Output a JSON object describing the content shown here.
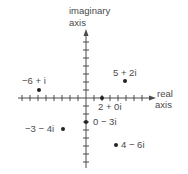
{
  "diagram": {
    "axes": {
      "imaginary_label_line1": "imaginary",
      "imaginary_label_line2": "axis",
      "real_label_line1": "real",
      "real_label_line2": "axis",
      "x_range": [
        -9,
        9
      ],
      "y_range": [
        -8,
        8
      ]
    },
    "points": [
      {
        "re": -6,
        "im": 1,
        "label": "−6 + i"
      },
      {
        "re": 5,
        "im": 2,
        "label": "5 + 2i"
      },
      {
        "re": 2,
        "im": 0,
        "label": "2 + 0i"
      },
      {
        "re": 0,
        "im": -3,
        "label": "0 − 3i"
      },
      {
        "re": -3,
        "im": -4,
        "label": "−3 − 4i"
      },
      {
        "re": 4,
        "im": -6,
        "label": "4 − 6i"
      }
    ],
    "colors": {
      "ink": "#4a4a4a",
      "dot": "#222222",
      "background": "#ffffff"
    }
  }
}
